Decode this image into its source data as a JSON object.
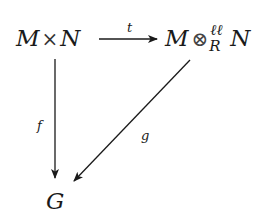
{
  "diagram": {
    "type": "commutative-triangle",
    "nodes": {
      "source": {
        "left": "M",
        "operator": "×",
        "right": "N"
      },
      "target_tensor": {
        "left": "M",
        "operator": "⊗",
        "superscript": "ℓℓ",
        "subscript": "R",
        "right": "N"
      },
      "codomain": {
        "label": "G"
      }
    },
    "arrows": {
      "top": {
        "label": "t",
        "from": "M × N",
        "to": "M ⊗^ℓℓ_R N"
      },
      "left": {
        "label": "f",
        "from": "M × N",
        "to": "G"
      },
      "diagonal": {
        "label": "g",
        "from": "M ⊗^ℓℓ_R N",
        "to": "G"
      }
    },
    "colors": {
      "ink": "#1a1a1a",
      "background": "#ffffff"
    }
  }
}
